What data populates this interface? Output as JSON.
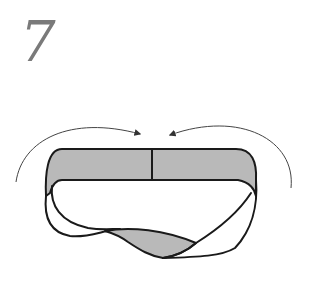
{
  "step": {
    "number": "7"
  },
  "figure": {
    "colors": {
      "band_fill": "#b9b9b9",
      "outline": "#1a1a1a",
      "arrow": "#444444",
      "step_number": "#7a7a7a",
      "background": "#ffffff"
    },
    "arrows": [
      {
        "name": "left-arrow",
        "direction": "clockwise toward center"
      },
      {
        "name": "right-arrow",
        "direction": "counter-clockwise toward center"
      }
    ]
  }
}
